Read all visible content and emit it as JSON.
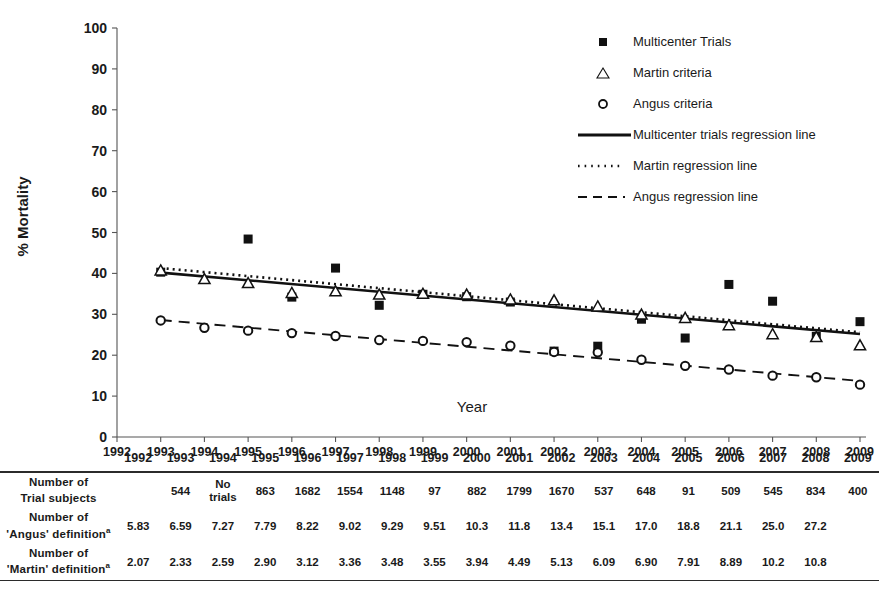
{
  "axes": {
    "y_title": "% Mortality",
    "x_title": "Year",
    "y_ticks": [
      "100",
      "90",
      "80",
      "70",
      "60",
      "50",
      "40",
      "30",
      "20",
      "10",
      "0"
    ],
    "x_ticks": [
      "1992",
      "1993",
      "1994",
      "1995",
      "1996",
      "1997",
      "1998",
      "1999",
      "2000",
      "2001",
      "2002",
      "2003",
      "2004",
      "2005",
      "2006",
      "2007",
      "2008",
      "2009"
    ]
  },
  "legend": {
    "items": [
      {
        "label": "Multicenter Trials",
        "key": "filled-square-marker"
      },
      {
        "label": "Martin criteria",
        "key": "open-triangle-marker"
      },
      {
        "label": "Angus criteria",
        "key": "open-circle-marker"
      },
      {
        "label": "Multicenter trials regression line",
        "key": "solid-line"
      },
      {
        "label": "Martin regression line",
        "key": "dotted-line"
      },
      {
        "label": "Angus regression line",
        "key": "dashed-line"
      }
    ]
  },
  "table": {
    "header_years": [
      "1992",
      "1993",
      "1994",
      "1995",
      "1996",
      "1997",
      "1998",
      "1999",
      "2000",
      "2001",
      "2002",
      "2003",
      "2004",
      "2005",
      "2006",
      "2007",
      "2008",
      "2009"
    ],
    "rows": [
      {
        "label_line1": "Number of",
        "label_line2": "Trial subjects",
        "footnote": "",
        "values": [
          "",
          "544",
          "No trials",
          "863",
          "1682",
          "1554",
          "1148",
          "97",
          "882",
          "1799",
          "1670",
          "537",
          "648",
          "91",
          "509",
          "545",
          "834",
          "400"
        ]
      },
      {
        "label_line1": "Number of",
        "label_line2": "'Angus' definition",
        "footnote": "a",
        "values": [
          "5.83",
          "6.59",
          "7.27",
          "7.79",
          "8.22",
          "9.02",
          "9.29",
          "9.51",
          "10.3",
          "11.8",
          "13.4",
          "15.1",
          "17.0",
          "18.8",
          "21.1",
          "25.0",
          "27.2",
          ""
        ]
      },
      {
        "label_line1": "Number of",
        "label_line2": "'Martin' definition",
        "footnote": "a",
        "values": [
          "2.07",
          "2.33",
          "2.59",
          "2.90",
          "3.12",
          "3.36",
          "3.48",
          "3.55",
          "3.94",
          "4.49",
          "5.13",
          "6.09",
          "6.90",
          "7.91",
          "8.89",
          "10.2",
          "10.8",
          ""
        ]
      }
    ]
  },
  "chart_data": {
    "type": "scatter",
    "title": "",
    "xlabel": "Year",
    "ylabel": "% Mortality",
    "xlim": [
      1992,
      2009
    ],
    "ylim": [
      0,
      100
    ],
    "ytick_step": 10,
    "grid": false,
    "legend_position": "top-right",
    "x": [
      1993,
      1994,
      1995,
      1996,
      1997,
      1998,
      1999,
      2000,
      2001,
      2002,
      2003,
      2004,
      2005,
      2006,
      2007,
      2008,
      2009
    ],
    "series": [
      {
        "name": "Multicenter Trials",
        "marker": "filled-square",
        "points": [
          {
            "x": 1993,
            "y": 40.3
          },
          {
            "x": 1995,
            "y": 48.4
          },
          {
            "x": 1996,
            "y": 34.2
          },
          {
            "x": 1997,
            "y": 41.3
          },
          {
            "x": 1998,
            "y": 32.2
          },
          {
            "x": 1999,
            "y": 34.9
          },
          {
            "x": 2000,
            "y": 34.3
          },
          {
            "x": 2001,
            "y": 33.0
          },
          {
            "x": 2002,
            "y": 21.0
          },
          {
            "x": 2003,
            "y": 22.2
          },
          {
            "x": 2004,
            "y": 28.8
          },
          {
            "x": 2005,
            "y": 24.2
          },
          {
            "x": 2006,
            "y": 37.3
          },
          {
            "x": 2007,
            "y": 33.2
          },
          {
            "x": 2008,
            "y": 24.6
          },
          {
            "x": 2009,
            "y": 28.2
          }
        ]
      },
      {
        "name": "Martin criteria",
        "marker": "open-triangle",
        "points": [
          {
            "x": 1993,
            "y": 40.7
          },
          {
            "x": 1994,
            "y": 38.6
          },
          {
            "x": 1995,
            "y": 37.6
          },
          {
            "x": 1996,
            "y": 35.2
          },
          {
            "x": 1997,
            "y": 35.6
          },
          {
            "x": 1998,
            "y": 34.8
          },
          {
            "x": 1999,
            "y": 35.0
          },
          {
            "x": 2000,
            "y": 34.8
          },
          {
            "x": 2001,
            "y": 33.6
          },
          {
            "x": 2002,
            "y": 33.4
          },
          {
            "x": 2003,
            "y": 31.9
          },
          {
            "x": 2004,
            "y": 29.9
          },
          {
            "x": 2005,
            "y": 29.1
          },
          {
            "x": 2006,
            "y": 27.3
          },
          {
            "x": 2007,
            "y": 25.1
          },
          {
            "x": 2008,
            "y": 24.4
          },
          {
            "x": 2009,
            "y": 22.4
          }
        ]
      },
      {
        "name": "Angus criteria",
        "marker": "open-circle",
        "points": [
          {
            "x": 1993,
            "y": 28.5
          },
          {
            "x": 1994,
            "y": 26.7
          },
          {
            "x": 1995,
            "y": 26.0
          },
          {
            "x": 1996,
            "y": 25.4
          },
          {
            "x": 1997,
            "y": 24.7
          },
          {
            "x": 1998,
            "y": 23.7
          },
          {
            "x": 1999,
            "y": 23.5
          },
          {
            "x": 2000,
            "y": 23.2
          },
          {
            "x": 2001,
            "y": 22.3
          },
          {
            "x": 2002,
            "y": 20.8
          },
          {
            "x": 2003,
            "y": 20.7
          },
          {
            "x": 2004,
            "y": 18.9
          },
          {
            "x": 2005,
            "y": 17.4
          },
          {
            "x": 2006,
            "y": 16.5
          },
          {
            "x": 2007,
            "y": 15.0
          },
          {
            "x": 2008,
            "y": 14.6
          },
          {
            "x": 2009,
            "y": 12.8
          }
        ]
      }
    ],
    "regression_lines": [
      {
        "name": "Multicenter trials regression line",
        "style": "solid",
        "x0": 1993,
        "y0": 40.2,
        "x1": 2009,
        "y1": 25.2
      },
      {
        "name": "Martin regression line",
        "style": "dotted",
        "x0": 1993,
        "y0": 41.3,
        "x1": 2009,
        "y1": 25.6
      },
      {
        "name": "Angus regression line",
        "style": "dashed",
        "x0": 1993,
        "y0": 28.6,
        "x1": 2009,
        "y1": 13.7
      }
    ]
  }
}
